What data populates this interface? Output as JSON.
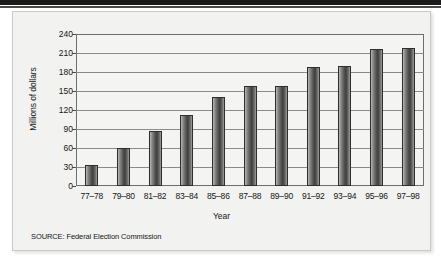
{
  "figure": {
    "background_color": "#f2f2f1",
    "accent_color": "#1b1b1b"
  },
  "source_note": "SOURCE: Federal Election Commission",
  "chart_data": {
    "type": "bar",
    "title": "",
    "xlabel": "Year",
    "ylabel": "Millions of dollars",
    "categories": [
      "77–78",
      "79–80",
      "81–82",
      "83–84",
      "85–86",
      "87–88",
      "89–90",
      "91–92",
      "93–94",
      "95–96",
      "97–98"
    ],
    "values": [
      33,
      60,
      87,
      112,
      140,
      158,
      158,
      188,
      189,
      217,
      218
    ],
    "ylim": [
      0,
      240
    ],
    "yticks": [
      0,
      30,
      60,
      90,
      120,
      150,
      180,
      210,
      240
    ],
    "ytick_labels": [
      "0",
      "30",
      "60",
      "90",
      "120",
      "150",
      "180",
      "210",
      "240"
    ],
    "grid": true,
    "grid_axis": "y",
    "legend": false,
    "bar_color": "#4a4a48",
    "series": [
      {
        "name": "Campaign spending",
        "values": [
          33,
          60,
          87,
          112,
          140,
          158,
          158,
          188,
          189,
          217,
          218
        ]
      }
    ]
  }
}
